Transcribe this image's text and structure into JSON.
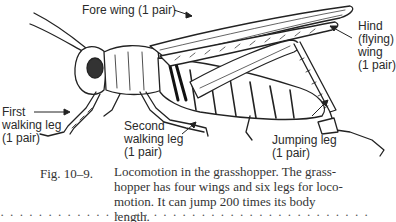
{
  "figure": {
    "labels": {
      "fore_wing": "Fore wing (1 pair)",
      "hind_wing": [
        "Hind",
        "(flying)",
        "wing",
        "(1 pair)"
      ],
      "first_walking_leg": [
        "First",
        "walking leg",
        "(1 pair)"
      ],
      "second_walking_leg": [
        "Second",
        "walking leg",
        "(1 pair)"
      ],
      "jumping_leg": [
        "Jumping leg",
        "(1 pair)"
      ]
    }
  },
  "caption": {
    "number": "Fig. 10–9.",
    "lines": [
      "Locomotion in the grasshopper. The grass-",
      "hopper has four wings and six legs for loco-",
      "motion. It can jump 200 times its body",
      "length."
    ]
  },
  "cutoff_text": "· · ·  · · · · ·  · · · · · · ·  · · · · · ·  · · · ·  · · · · · ·  · · · · · · · ·"
}
